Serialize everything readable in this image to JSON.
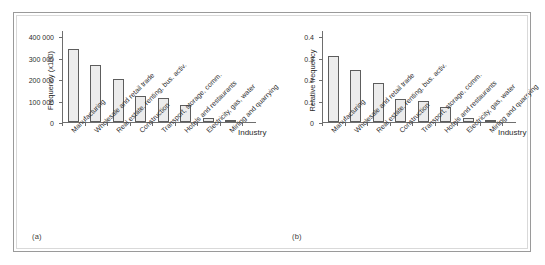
{
  "figure": {
    "panels": [
      {
        "caption": "(a)",
        "ylabel": "Frequency (x100)",
        "xlabel": "Industry"
      },
      {
        "caption": "(b)",
        "ylabel": "Relative frequency",
        "xlabel": "Industry"
      }
    ]
  },
  "chart_data": [
    {
      "type": "bar",
      "title": "",
      "xlabel": "Industry",
      "ylabel": "Frequency (x100)",
      "categories": [
        "Manufacturing",
        "Wholesale and retail trade",
        "Real estate, renting, bus. activ.",
        "Construction",
        "Transport, storage, comm.",
        "Hotels and restaurants",
        "Electricity, gas, water",
        "Mining and quarrying"
      ],
      "values": [
        340000,
        265000,
        202000,
        120000,
        110000,
        78000,
        18000,
        11000
      ],
      "ylim": [
        0,
        400000
      ],
      "yticks": [
        0,
        100000,
        200000,
        300000,
        400000
      ],
      "ytick_labels": [
        "0",
        "100 000",
        "200 000",
        "300 000",
        "400 000"
      ],
      "grid": false,
      "legend": "none"
    },
    {
      "type": "bar",
      "title": "",
      "xlabel": "Industry",
      "ylabel": "Relative frequency",
      "categories": [
        "Manufacturing",
        "Wholesale and retail trade",
        "Real estate, renting, bus. activ.",
        "Construction",
        "Transport, storage, comm.",
        "Hotels and restaurants",
        "Electricity, gas, water",
        "Mining and quarrying"
      ],
      "values": [
        0.305,
        0.24,
        0.18,
        0.108,
        0.1,
        0.07,
        0.017,
        0.01
      ],
      "ylim": [
        0,
        0.4
      ],
      "yticks": [
        0,
        0.1,
        0.2,
        0.3,
        0.4
      ],
      "ytick_labels": [
        "0",
        "0.1",
        "0.2",
        "0.3",
        "0.4"
      ],
      "grid": false,
      "legend": "none"
    }
  ],
  "style": {
    "bar_fill": "#ececec",
    "bar_edge": "#5d5d5d",
    "axis_color": "#6e6e6e",
    "text_color": "#2e2e2e",
    "frame_color": "#9a9a9a",
    "background": "#ffffff"
  }
}
